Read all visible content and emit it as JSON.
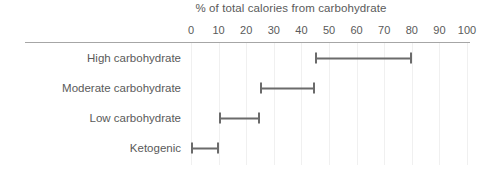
{
  "chart_data": {
    "type": "bar",
    "subtype": "range-bar",
    "title": "% of total calories from carbohydrate",
    "xlabel": "",
    "ylabel": "",
    "xlim": [
      0,
      100
    ],
    "xticks": [
      0,
      10,
      20,
      30,
      40,
      50,
      60,
      70,
      80,
      90,
      100
    ],
    "xtick_labels": [
      "0",
      "10",
      "20",
      "30",
      "40",
      "50",
      "60",
      "70",
      "80",
      "90",
      "100"
    ],
    "grid": true,
    "grid_axis": "x",
    "legend": false,
    "categories": [
      "High carbohydrate",
      "Moderate carbohydrate",
      "Low carbohydrate",
      "Ketogenic"
    ],
    "ranges": [
      {
        "category": "High carbohydrate",
        "start": 45,
        "end": 80
      },
      {
        "category": "Moderate carbohydrate",
        "start": 25,
        "end": 45
      },
      {
        "category": "Low carbohydrate",
        "start": 10,
        "end": 25
      },
      {
        "category": "Ketogenic",
        "start": 0,
        "end": 10
      }
    ],
    "colors": {
      "bar": "#6b6b6b",
      "axis": "#a6a6a6",
      "grid": "#f0f0f0",
      "text": "#5a5a5a",
      "background": "#ffffff"
    }
  }
}
